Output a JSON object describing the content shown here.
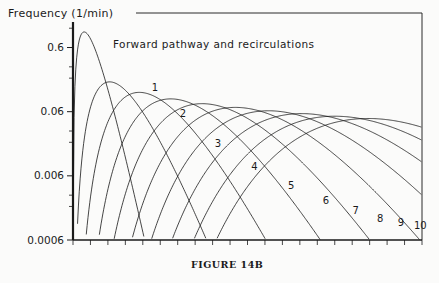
{
  "figure": {
    "caption": "FIGURE 14B",
    "axis_label": "Frequency (1/min)",
    "plot_title": "Forward pathway and recirculations"
  },
  "chart_data": {
    "type": "line",
    "title": "Forward pathway and recirculations",
    "xlabel": "",
    "ylabel": "Frequency (1/min)",
    "yscale": "log",
    "ylim": [
      0.0006,
      1.5
    ],
    "xlim": [
      0,
      100
    ],
    "grid": false,
    "legend": "inline-curve-labels",
    "ytick_labels": [
      "0.6",
      "0.06",
      "0.006",
      "0.0006"
    ],
    "ytick_values": [
      0.6,
      0.06,
      0.006,
      0.0006
    ],
    "xtick_count": 20,
    "series": [
      {
        "name": "1",
        "label": "1",
        "peak_x": 3.2,
        "peak_y": 1.05,
        "shape": 2.1,
        "label_x": 23.5,
        "label_y": 0.125
      },
      {
        "name": "2",
        "label": "2",
        "peak_x": 10.5,
        "peak_y": 0.175,
        "shape": 4.2,
        "label_x": 31.5,
        "label_y": 0.05
      },
      {
        "name": "3",
        "label": "3",
        "peak_x": 19.0,
        "peak_y": 0.12,
        "shape": 6.3,
        "label_x": 41.5,
        "label_y": 0.017
      },
      {
        "name": "4",
        "label": "4",
        "peak_x": 28.0,
        "peak_y": 0.095,
        "shape": 8.4,
        "label_x": 52.0,
        "label_y": 0.0073
      },
      {
        "name": "5",
        "label": "5",
        "peak_x": 37.0,
        "peak_y": 0.08,
        "shape": 10.5,
        "label_x": 62.5,
        "label_y": 0.0037
      },
      {
        "name": "6",
        "label": "6",
        "peak_x": 46.5,
        "peak_y": 0.07,
        "shape": 12.6,
        "label_x": 72.5,
        "label_y": 0.0022
      },
      {
        "name": "7",
        "label": "7",
        "peak_x": 56.0,
        "peak_y": 0.062,
        "shape": 14.7,
        "label_x": 81.0,
        "label_y": 0.0015
      },
      {
        "name": "8",
        "label": "8",
        "peak_x": 65.5,
        "peak_y": 0.056,
        "shape": 16.8,
        "label_x": 88.0,
        "label_y": 0.00115
      },
      {
        "name": "9",
        "label": "9",
        "peak_x": 75.0,
        "peak_y": 0.051,
        "shape": 18.9,
        "label_x": 94.0,
        "label_y": 0.00098
      },
      {
        "name": "10",
        "label": "10",
        "peak_x": 84.5,
        "peak_y": 0.047,
        "shape": 21.0,
        "label_x": 99.5,
        "label_y": 0.00088
      }
    ]
  },
  "colors": {
    "curve": "#161616",
    "axis": "#1a1a1a",
    "background": "#fbfbfa"
  }
}
